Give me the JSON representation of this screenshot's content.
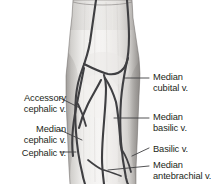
{
  "figure": {
    "background_color": "#ffffff",
    "vein_color": "#3f3f42",
    "skin_light": "#f2f1ef",
    "skin_mid": "#e2e0dd",
    "skin_shadow": "#a8a5a2",
    "text_color": "#231f20"
  },
  "labels": {
    "accessory_cephalic": {
      "line1": "Accessory",
      "line2": "cephalic v.",
      "side": "left"
    },
    "median_cephalic": {
      "line1": "Median",
      "line2": "cephalic v.",
      "side": "left"
    },
    "cephalic": {
      "line1": "Cephalic v.",
      "line2": "",
      "side": "left"
    },
    "median_cubital": {
      "line1": "Median",
      "line2": "cubital v.",
      "side": "right"
    },
    "median_basilic": {
      "line1": "Median",
      "line2": "basilic v.",
      "side": "right"
    },
    "basilic": {
      "line1": "Basilic v.",
      "line2": "",
      "side": "right"
    },
    "median_antebrachial": {
      "line1": "Median",
      "line2": "antebrachial v.",
      "side": "right"
    }
  },
  "structures": [
    {
      "name": "accessory-cephalic-vein"
    },
    {
      "name": "median-cephalic-vein"
    },
    {
      "name": "cephalic-vein"
    },
    {
      "name": "median-cubital-vein"
    },
    {
      "name": "median-basilic-vein"
    },
    {
      "name": "basilic-vein"
    },
    {
      "name": "median-antebrachial-vein"
    },
    {
      "name": "arm-limb"
    }
  ]
}
